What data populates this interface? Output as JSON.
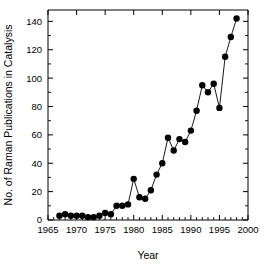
{
  "chart_data": {
    "type": "line",
    "title": "",
    "xlabel": "Year",
    "ylabel": "No. of Raman Publications in Catalysis",
    "xlim": [
      1965,
      2000
    ],
    "ylim": [
      0,
      148
    ],
    "xticks": [
      1965,
      1970,
      1975,
      1980,
      1985,
      1990,
      1995,
      2000
    ],
    "xtick_labels": [
      "1965",
      "1970",
      "1975",
      "1980",
      "1985",
      "1990",
      "1995",
      "2000"
    ],
    "yticks": [
      0,
      20,
      40,
      60,
      80,
      100,
      120,
      140
    ],
    "ytick_labels": [
      "0",
      "20",
      "40",
      "60",
      "80",
      "100",
      "120",
      "140"
    ],
    "x_minor_interval": 1,
    "y_minor_interval": 10,
    "grid": false,
    "legend": null,
    "marker": "filled-circle",
    "marker_color": "#000000",
    "line_color": "#000000",
    "x": [
      1967,
      1968,
      1969,
      1970,
      1971,
      1972,
      1973,
      1974,
      1975,
      1976,
      1977,
      1978,
      1979,
      1980,
      1981,
      1982,
      1983,
      1984,
      1985,
      1986,
      1987,
      1988,
      1989,
      1990,
      1991,
      1992,
      1993,
      1994,
      1995,
      1996,
      1997,
      1998
    ],
    "values": [
      3,
      4,
      3,
      3,
      3,
      2,
      2,
      3,
      5,
      4,
      10,
      10,
      11,
      29,
      16,
      15,
      21,
      32,
      40,
      58,
      49,
      57,
      55,
      63,
      77,
      95,
      90,
      96,
      79,
      115,
      129,
      142
    ],
    "series": [
      {
        "name": "No. of Raman Publications in Catalysis",
        "values": [
          3,
          4,
          3,
          3,
          3,
          2,
          2,
          3,
          5,
          4,
          10,
          10,
          11,
          29,
          16,
          15,
          21,
          32,
          40,
          58,
          49,
          57,
          55,
          63,
          77,
          95,
          90,
          96,
          79,
          115,
          129,
          142
        ]
      }
    ]
  }
}
